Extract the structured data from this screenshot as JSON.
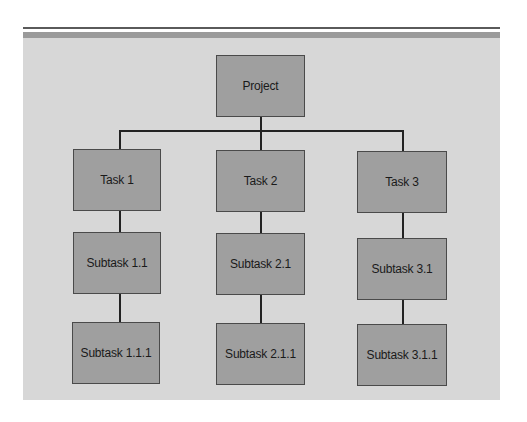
{
  "diagram": {
    "type": "work-breakdown-structure",
    "root": {
      "label": "Project"
    },
    "tasks": [
      {
        "label": "Task 1",
        "subtask": {
          "label": "Subtask 1.1"
        },
        "subsubtask": {
          "label": "Subtask 1.1.1"
        }
      },
      {
        "label": "Task 2",
        "subtask": {
          "label": "Subtask 2.1"
        },
        "subsubtask": {
          "label": "Subtask 2.1.1"
        }
      },
      {
        "label": "Task 3",
        "subtask": {
          "label": "Subtask 3.1"
        },
        "subsubtask": {
          "label": "Subtask 3.1.1"
        }
      }
    ],
    "colors": {
      "panel_background": "#d7d7d7",
      "header_band": "#9a9a9a",
      "top_rule": "#5a5a5a",
      "node_fill": "#9f9f9f",
      "node_border": "#4a4a4a",
      "connector": "#222222",
      "text": "#1a1a1a"
    }
  }
}
